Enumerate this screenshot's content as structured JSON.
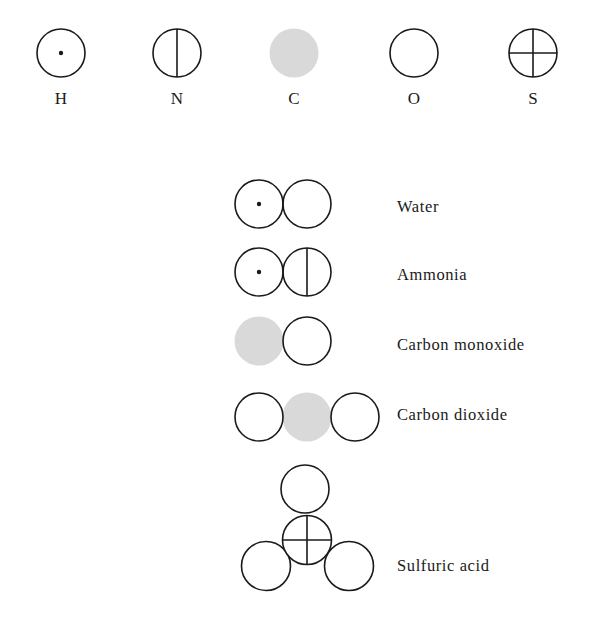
{
  "colors": {
    "stroke": "#1a1a1a",
    "carbon_fill": "#d9d9d9",
    "background": "#ffffff"
  },
  "elements": [
    {
      "symbol": "H",
      "icon": "circle-with-dot"
    },
    {
      "symbol": "N",
      "icon": "circle-with-vertical-line"
    },
    {
      "symbol": "C",
      "icon": "filled-gray-circle"
    },
    {
      "symbol": "O",
      "icon": "empty-circle"
    },
    {
      "symbol": "S",
      "icon": "circle-with-cross"
    }
  ],
  "molecules": [
    {
      "name": "Water",
      "atoms": [
        "H",
        "O"
      ]
    },
    {
      "name": "Ammonia",
      "atoms": [
        "H",
        "N"
      ]
    },
    {
      "name": "Carbon monoxide",
      "atoms": [
        "C",
        "O"
      ]
    },
    {
      "name": "Carbon dioxide",
      "atoms": [
        "O",
        "C",
        "O"
      ]
    },
    {
      "name": "Sulfuric acid",
      "atoms": [
        "O",
        "S",
        "O",
        "O"
      ]
    }
  ]
}
